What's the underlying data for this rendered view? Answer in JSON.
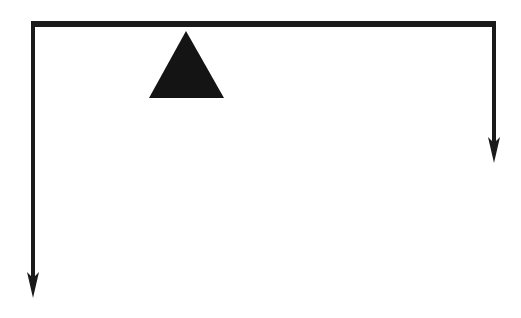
{
  "diagram": {
    "type": "lever-balance",
    "background": "#ffffff",
    "ink_color": "#1a1a1a",
    "beam": {
      "x1": 31,
      "x2": 496,
      "y": 24,
      "thickness": 6
    },
    "fulcrum": {
      "apex": [
        186,
        31
      ],
      "base_left": [
        149,
        98
      ],
      "base_right": [
        224,
        98
      ]
    },
    "left_force_arrow": {
      "x": 33,
      "y_start": 27,
      "y_end": 298,
      "direction": "down",
      "relative_length": "long"
    },
    "right_force_arrow": {
      "x": 494,
      "y_start": 27,
      "y_end": 163,
      "direction": "down",
      "relative_length": "short"
    }
  }
}
